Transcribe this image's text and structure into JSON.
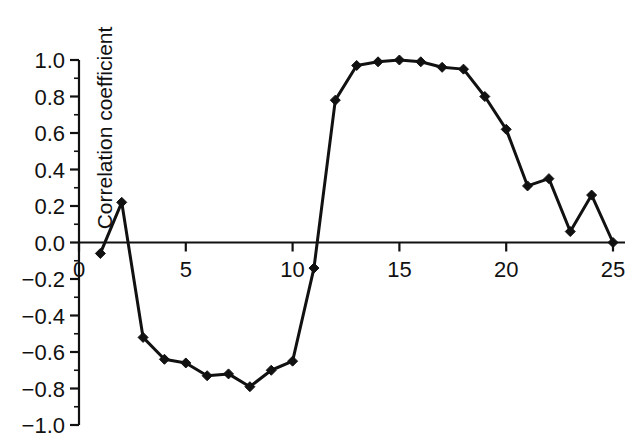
{
  "chart_data": {
    "type": "line",
    "title": "",
    "subtitle": "",
    "xlabel": "",
    "ylabel": "Correlation coefficient",
    "x": [
      1,
      2,
      3,
      4,
      5,
      6,
      7,
      8,
      9,
      10,
      11,
      12,
      13,
      14,
      15,
      16,
      17,
      18,
      19,
      20,
      21,
      22,
      23,
      24,
      25
    ],
    "values": [
      -0.06,
      0.22,
      -0.52,
      -0.64,
      -0.66,
      -0.73,
      -0.72,
      -0.79,
      -0.7,
      -0.65,
      -0.14,
      0.78,
      0.97,
      0.99,
      1.0,
      0.99,
      0.96,
      0.95,
      0.8,
      0.62,
      0.31,
      0.35,
      0.06,
      0.26,
      0.0
    ],
    "series": [
      {
        "name": "Correlation coefficient",
        "values": [
          -0.06,
          0.22,
          -0.52,
          -0.64,
          -0.66,
          -0.73,
          -0.72,
          -0.79,
          -0.7,
          -0.65,
          -0.14,
          0.78,
          0.97,
          0.99,
          1.0,
          0.99,
          0.96,
          0.95,
          0.8,
          0.62,
          0.31,
          0.35,
          0.06,
          0.26,
          0.0
        ]
      }
    ],
    "xlim": [
      0,
      25
    ],
    "ylim": [
      -1.0,
      1.0
    ],
    "xticks": [
      0,
      5,
      10,
      15,
      20,
      25
    ],
    "xtick_labels": [
      "0",
      "5",
      "10",
      "15",
      "20",
      "25"
    ],
    "yticks": [
      -1.0,
      -0.8,
      -0.6,
      -0.4,
      -0.2,
      0.0,
      0.2,
      0.4,
      0.6,
      0.8,
      1.0
    ],
    "ytick_labels": [
      "−1.0",
      "−0.8",
      "−0.6",
      "−0.4",
      "−0.2",
      "0.0",
      "0.2",
      "0.4",
      "0.6",
      "0.8",
      "1.0"
    ],
    "y_minor_ticks": [
      -0.9,
      -0.7,
      -0.5,
      -0.3,
      -0.1,
      0.1,
      0.3,
      0.5,
      0.7,
      0.9
    ],
    "grid": false,
    "legend": false,
    "legend_position": "none",
    "marker": "diamond",
    "line_color": "#111111",
    "marker_color": "#111111",
    "line_width": 3,
    "background_color": "#ffffff",
    "annotations": []
  },
  "axes": {
    "y_axis_title": "Correlation coefficient",
    "x_axis_title": ""
  }
}
